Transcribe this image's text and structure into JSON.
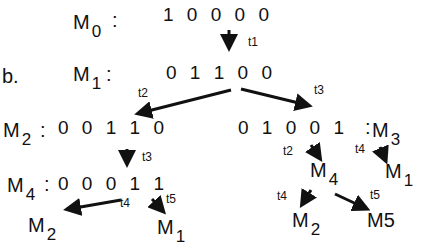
{
  "figure_label": "b.",
  "markings": {
    "m0": {
      "name": "M",
      "sub": "0",
      "sep": ":",
      "tokens": "1  0  0  0  0"
    },
    "m1": {
      "name": "M",
      "sub": "1",
      "sep": ":",
      "tokens": "0  1  1  0  0"
    },
    "m2": {
      "name": "M",
      "sub": "2",
      "sep": ":",
      "tokens": "0  0  1  1  0"
    },
    "m3": {
      "name": "M",
      "sub": "3",
      "sep": ":",
      "tokens": "0  1  0  0  1"
    },
    "m4": {
      "name": "M",
      "sub": "4",
      "sep": ":",
      "tokens": "0  0  0  1  1"
    }
  },
  "transitions": {
    "m0_m1": "t1",
    "m1_m2": "t2",
    "m1_m3": "t3",
    "m2_m4": "t3",
    "m4_m2": "t4",
    "m4_m1": "t5",
    "m3_m4": "t2",
    "m3_m1": "t4",
    "m4b_m2": "t4",
    "m4b_m5": "t5"
  },
  "leaves": {
    "m4_left_m2": {
      "name": "M",
      "sub": "2"
    },
    "m4_left_m1": {
      "name": "M",
      "sub": "1"
    },
    "m3_right_m4": {
      "name": "M",
      "sub": "4"
    },
    "m3_right_m1": {
      "name": "M",
      "sub": "1"
    },
    "m4_right_m2": {
      "name": "M",
      "sub": "2"
    },
    "m4_right_m5": {
      "name": "M5"
    }
  }
}
